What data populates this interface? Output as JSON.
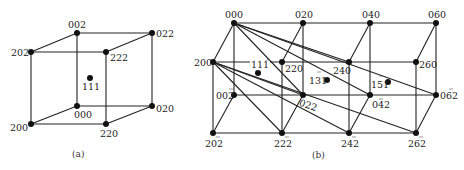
{
  "panel_a": {
    "caption": "(a)",
    "nodes": [
      {
        "id": "002",
        "label": "002",
        "x": 77,
        "y": 33
      },
      {
        "id": "022",
        "label": "022",
        "x": 152,
        "y": 33
      },
      {
        "id": "202",
        "label": "202",
        "x": 31,
        "y": 52
      },
      {
        "id": "222",
        "label": "222",
        "x": 106,
        "y": 52
      },
      {
        "id": "111",
        "label": "111",
        "x": 90,
        "y": 78
      },
      {
        "id": "000",
        "label": "000",
        "x": 77,
        "y": 106
      },
      {
        "id": "020",
        "label": "020",
        "x": 152,
        "y": 106
      },
      {
        "id": "200",
        "label": "200",
        "x": 31,
        "y": 124
      },
      {
        "id": "220",
        "label": "220",
        "x": 106,
        "y": 124
      }
    ]
  },
  "panel_b": {
    "caption": "(b)",
    "nodes": [
      {
        "id": "000",
        "label": "000",
        "x": 234,
        "y": 23
      },
      {
        "id": "020",
        "label": "020",
        "x": 303,
        "y": 23
      },
      {
        "id": "040",
        "label": "040",
        "x": 370,
        "y": 23
      },
      {
        "id": "060",
        "label": "060",
        "x": 436,
        "y": 23
      },
      {
        "id": "200",
        "label": "200",
        "x": 213,
        "y": 62
      },
      {
        "id": "220",
        "label": "220",
        "x": 282,
        "y": 62
      },
      {
        "id": "240",
        "label": "240",
        "x": 349,
        "y": 62
      },
      {
        "id": "260",
        "label": "260",
        "x": 416,
        "y": 62
      },
      {
        "id": "111",
        "label": "111",
        "x": 258,
        "y": 73
      },
      {
        "id": "131",
        "label": "131",
        "x": 327,
        "y": 80
      },
      {
        "id": "151",
        "label": "151",
        "x": 388,
        "y": 82
      },
      {
        "id": "002",
        "label": "002",
        "x": 234,
        "y": 95
      },
      {
        "id": "022",
        "label": "022",
        "x": 303,
        "y": 95
      },
      {
        "id": "042",
        "label": "042",
        "x": 370,
        "y": 95
      },
      {
        "id": "062",
        "label": "062",
        "x": 436,
        "y": 95
      },
      {
        "id": "202",
        "label": "202",
        "x": 213,
        "y": 133
      },
      {
        "id": "222",
        "label": "222",
        "x": 282,
        "y": 133
      },
      {
        "id": "242",
        "label": "242",
        "x": 349,
        "y": 133
      },
      {
        "id": "262",
        "label": "262",
        "x": 416,
        "y": 133
      }
    ]
  }
}
